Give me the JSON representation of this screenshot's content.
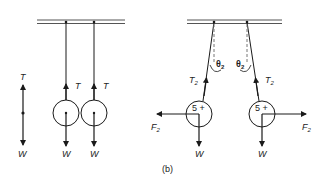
{
  "figure": {
    "panel_b_label": "(b)"
  },
  "left_panel": {
    "tension_label": "T",
    "weight_label": "W",
    "free_body": {
      "top_label": "T",
      "bottom_label": "W"
    },
    "spheres": [
      {
        "tension_label": "T",
        "weight_label": "W"
      },
      {
        "tension_label": "T",
        "weight_label": "W"
      }
    ]
  },
  "right_panel": {
    "spheres": [
      {
        "charge_label": "5 +",
        "tension_label": "T",
        "tension_sub": "2",
        "force_label": "F",
        "force_sub": "2",
        "weight_label": "W",
        "angle_label": "θ",
        "angle_sub": "2"
      },
      {
        "charge_label": "5 +",
        "tension_label": "T",
        "tension_sub": "2",
        "force_label": "F",
        "force_sub": "2",
        "weight_label": "W",
        "angle_label": "θ",
        "angle_sub": "2"
      }
    ]
  },
  "colors": {
    "line": "#1a1a1a",
    "bar": "#555555",
    "dashed": "#777777"
  }
}
